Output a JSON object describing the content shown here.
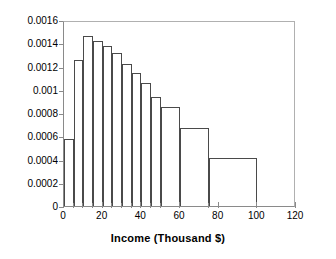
{
  "chart_data": {
    "type": "bar",
    "title": "",
    "subtitle": "",
    "xlabel": "Income   (Thousand $)",
    "ylabel": "",
    "xlim": [
      0,
      120
    ],
    "ylim": [
      0,
      0.0016
    ],
    "grid": false,
    "legend": null,
    "histogram": true,
    "note": "Density histogram with unequal bin widths; bar height = relative frequency density",
    "bins": [
      {
        "start": 0,
        "end": 5,
        "density": 0.00058
      },
      {
        "start": 5,
        "end": 10,
        "density": 0.00126
      },
      {
        "start": 10,
        "end": 15,
        "density": 0.00146
      },
      {
        "start": 15,
        "end": 20,
        "density": 0.00142
      },
      {
        "start": 20,
        "end": 25,
        "density": 0.00138
      },
      {
        "start": 25,
        "end": 30,
        "density": 0.00132
      },
      {
        "start": 30,
        "end": 35,
        "density": 0.00122
      },
      {
        "start": 35,
        "end": 40,
        "density": 0.00114
      },
      {
        "start": 40,
        "end": 45,
        "density": 0.00106
      },
      {
        "start": 45,
        "end": 50,
        "density": 0.00094
      },
      {
        "start": 50,
        "end": 60,
        "density": 0.00085
      },
      {
        "start": 60,
        "end": 75,
        "density": 0.00067
      },
      {
        "start": 75,
        "end": 100,
        "density": 0.00041
      }
    ],
    "categories": [
      "0-5",
      "5-10",
      "10-15",
      "15-20",
      "20-25",
      "25-30",
      "30-35",
      "35-40",
      "40-45",
      "45-50",
      "50-60",
      "60-75",
      "75-100"
    ],
    "values": [
      0.00058,
      0.00126,
      0.00146,
      0.00142,
      0.00138,
      0.00132,
      0.00122,
      0.00114,
      0.00106,
      0.00094,
      0.00085,
      0.00067,
      0.00041
    ],
    "y_ticks": [
      0,
      0.0002,
      0.0004,
      0.0006,
      0.0008,
      0.001,
      0.0012,
      0.0014,
      0.0016
    ],
    "y_tick_labels": [
      "0",
      "0.0002",
      "0.0004",
      "0.0006",
      "0.0008",
      "0.001",
      "0.0012",
      "0.0014",
      "0.0016"
    ],
    "x_ticks": [
      0,
      20,
      40,
      60,
      80,
      100,
      120
    ],
    "x_tick_labels": [
      "0",
      "20",
      "40",
      "60",
      "80",
      "100",
      "120"
    ],
    "x_minor_ticks": [
      5,
      10,
      15,
      25,
      30,
      35,
      45,
      50,
      75
    ],
    "colors": {
      "bar_edge": "#4a4a4a",
      "bar_fill": "transparent",
      "axis": "#8a8a8a",
      "frame": "#b0b0b0",
      "text": "#000000"
    }
  }
}
